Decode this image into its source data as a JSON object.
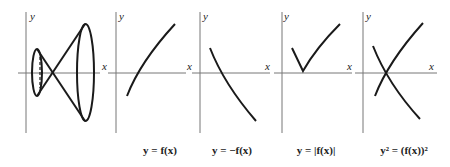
{
  "panels": [
    {
      "id": "cone",
      "x_label": "x",
      "y_label": "y",
      "caption": ""
    },
    {
      "id": "f",
      "x_label": "x",
      "y_label": "y",
      "caption": "y = f(x)"
    },
    {
      "id": "neg_f",
      "x_label": "x",
      "y_label": "y",
      "caption": "y = −f(x)"
    },
    {
      "id": "abs_f",
      "x_label": "x",
      "y_label": "y",
      "caption": "y = |f(x)|"
    },
    {
      "id": "sq_f",
      "x_label": "x",
      "y_label": "y",
      "caption": "y² = (f(x))²"
    }
  ],
  "colors": {
    "axis": "#777777",
    "curve": "#1a1a1a",
    "text": "#222222"
  }
}
